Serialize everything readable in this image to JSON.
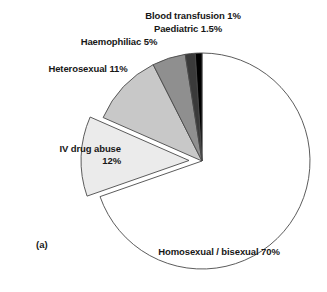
{
  "figure": {
    "caption": "(a)",
    "background": "#ffffff"
  },
  "chart_data": {
    "type": "pie",
    "title": "",
    "xlabel": "",
    "ylabel": "",
    "legend_position": "none",
    "grid": false,
    "units": "percent",
    "start_angle_deg": 0,
    "direction": "clockwise",
    "center": {
      "x": 202,
      "y": 161
    },
    "radius": 108,
    "categories": [
      "Homosexual / bisexual",
      "IV drug abuse",
      "Heterosexual",
      "Haemophiliac",
      "Paediatric",
      "Blood transfusion"
    ],
    "values": [
      70,
      12,
      11,
      5,
      1.5,
      1
    ],
    "labels": [
      "Homosexual / bisexual 70%",
      "IV drug abuse 12%",
      "Heterosexual 11%",
      "Haemophiliac 5%",
      "Paediatric 1.5%",
      "Blood transfusion 1%"
    ],
    "colors": [
      "#ffffff",
      "#ebebeb",
      "#c8c8c8",
      "#8f8f8f",
      "#3a3a3a",
      "#000000"
    ],
    "outline_color": "#4a4a4a",
    "exploded": [
      false,
      true,
      false,
      false,
      false,
      false
    ],
    "slices": [
      {
        "name": "Homosexual / bisexual",
        "value": 70,
        "label": "Homosexual / bisexual 70%",
        "color": "#ffffff",
        "exploded": false
      },
      {
        "name": "IV drug abuse",
        "value": 12,
        "label": "IV drug abuse 12%",
        "color": "#ebebeb",
        "exploded": true
      },
      {
        "name": "Heterosexual",
        "value": 11,
        "label": "Heterosexual 11%",
        "color": "#c8c8c8",
        "exploded": false
      },
      {
        "name": "Haemophiliac",
        "value": 5,
        "label": "Haemophiliac 5%",
        "color": "#8f8f8f",
        "exploded": false
      },
      {
        "name": "Paediatric",
        "value": 1.5,
        "label": "Paediatric 1.5%",
        "color": "#3a3a3a",
        "exploded": false
      },
      {
        "name": "Blood transfusion",
        "value": 1,
        "label": "Blood transfusion 1%",
        "color": "#000000",
        "exploded": false
      }
    ]
  },
  "labels": {
    "blood_transfusion": "Blood transfusion 1%",
    "paediatric": "Paediatric 1.5%",
    "haemophiliac": "Haemophiliac 5%",
    "heterosexual": "Heterosexual 11%",
    "iv_drug_abuse": "IV drug abuse\n12%",
    "iv_drug_abuse_line1": "IV drug abuse",
    "iv_drug_abuse_line2": "12%",
    "homosexual": "Homosexual / bisexual 70%"
  }
}
